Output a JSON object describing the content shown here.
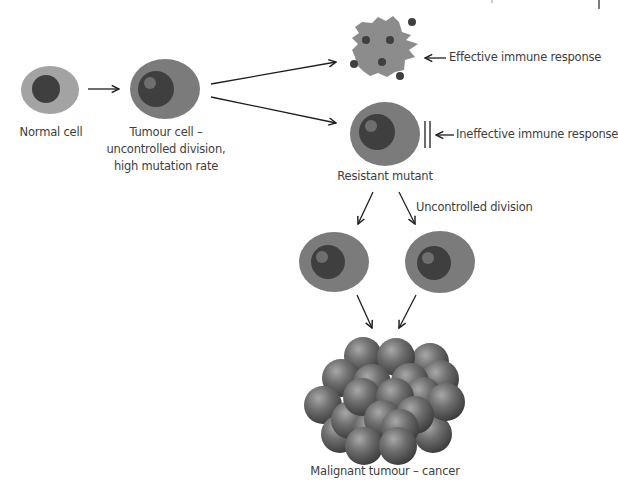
{
  "diagram": {
    "stages": {
      "normal_cell": {
        "label": "Normal cell"
      },
      "tumour_cell": {
        "label_lines": [
          "Tumour cell –",
          "uncontrolled division,",
          "high mutation rate"
        ]
      },
      "destroyed_cell": {
        "annotation": "Effective immune response"
      },
      "resistant_mutant": {
        "label": "Resistant mutant",
        "annotation": "Ineffective immune response"
      },
      "division": {
        "annotation": "Uncontrolled division"
      },
      "malignant_tumour": {
        "label": "Malignant tumour – cancer"
      }
    },
    "colors": {
      "cytoplasm": "#7b7b7b",
      "cytoplasm_light": "#a3a3a3",
      "nucleus": "#3f3f3f",
      "nucleolus": "#6e6e6e",
      "arrow": "#1e1e1e",
      "tumour_sphere": "#6a6a6a"
    }
  }
}
